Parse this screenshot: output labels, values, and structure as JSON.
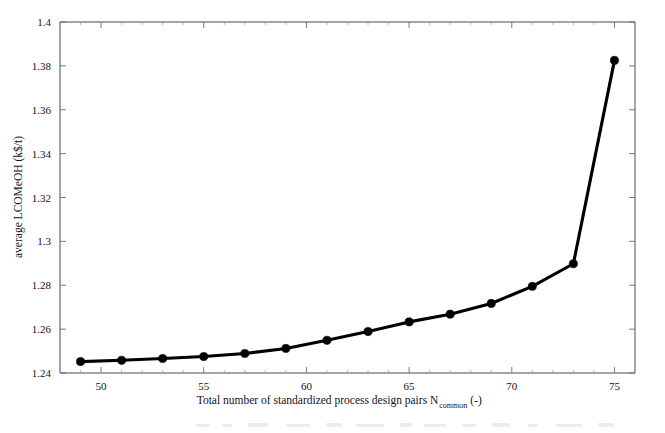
{
  "chart_data": {
    "type": "line",
    "title": "",
    "subtitle": "",
    "xlabel": "Total number of standardized process design pairs N",
    "xlabel_subscript": "common",
    "xlabel_units": "(-)",
    "ylabel": "average LCOMeOH (k$/t)",
    "xlim": [
      48,
      76
    ],
    "ylim": [
      1.24,
      1.4
    ],
    "xticks": [
      50,
      55,
      60,
      65,
      70,
      75
    ],
    "yticks": [
      1.24,
      1.26,
      1.28,
      1.3,
      1.32,
      1.34,
      1.36,
      1.38,
      1.4
    ],
    "xtick_labels": [
      "50",
      "55",
      "60",
      "65",
      "70",
      "75"
    ],
    "ytick_labels": [
      "1.24",
      "1.26",
      "1.28",
      "1.3",
      "1.32",
      "1.34",
      "1.36",
      "1.38",
      "1.4"
    ],
    "grid": false,
    "legend": null,
    "legend_position": "none",
    "marker": "circle",
    "line_color": "#000000",
    "x": [
      49,
      51,
      53,
      55,
      57,
      59,
      61,
      63,
      65,
      67,
      69,
      71,
      73,
      75
    ],
    "values": [
      1.2452,
      1.2458,
      1.2466,
      1.2475,
      1.2489,
      1.2512,
      1.2549,
      1.2589,
      1.2633,
      1.2668,
      1.2717,
      1.2795,
      1.2898,
      1.3825
    ],
    "series": [
      {
        "name": "average LCOMeOH",
        "values": [
          1.2452,
          1.2458,
          1.2466,
          1.2475,
          1.2489,
          1.2512,
          1.2549,
          1.2589,
          1.2633,
          1.2668,
          1.2717,
          1.2795,
          1.2898,
          1.3825
        ]
      }
    ]
  },
  "figure": {
    "background_color": "#ffffff",
    "axis_color": "#4a4a4a"
  }
}
